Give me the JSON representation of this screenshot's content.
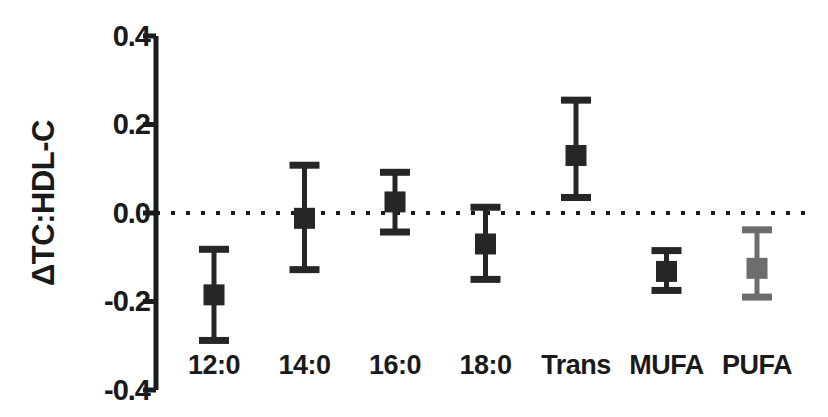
{
  "chart_data": {
    "type": "scatter",
    "title": "",
    "xlabel": "",
    "ylabel": "ΔTC:HDL-C",
    "ylim": [
      -0.4,
      0.4
    ],
    "yticks": [
      0.4,
      0.2,
      0.0,
      -0.2,
      -0.4
    ],
    "ytick_labels": [
      "0.4",
      "0.2",
      "0.0",
      "-0.2",
      "-0.4"
    ],
    "grid": false,
    "legend": "none",
    "zero_reference_line": {
      "value": 0.0,
      "style": "dotted"
    },
    "categories": [
      "12:0",
      "14:0",
      "16:0",
      "18:0",
      "Trans",
      "MUFA",
      "PUFA"
    ],
    "values": [
      -0.185,
      -0.012,
      0.025,
      -0.07,
      0.13,
      -0.132,
      -0.125
    ],
    "error_low": [
      -0.288,
      -0.128,
      -0.043,
      -0.15,
      0.035,
      -0.175,
      -0.19
    ],
    "error_high": [
      -0.082,
      0.108,
      0.092,
      0.013,
      0.255,
      -0.085,
      -0.038
    ],
    "marker_colors": [
      "#262626",
      "#262626",
      "#262626",
      "#262626",
      "#262626",
      "#262626",
      "#6d6d6d"
    ],
    "series": [
      {
        "name": "ΔTC:HDL-C",
        "points": [
          {
            "category": "12:0",
            "value": -0.185,
            "low": -0.288,
            "high": -0.082,
            "color": "#262626"
          },
          {
            "category": "14:0",
            "value": -0.012,
            "low": -0.128,
            "high": 0.108,
            "color": "#262626"
          },
          {
            "category": "16:0",
            "value": 0.025,
            "low": -0.043,
            "high": 0.092,
            "color": "#262626"
          },
          {
            "category": "18:0",
            "value": -0.07,
            "low": -0.15,
            "high": 0.013,
            "color": "#262626"
          },
          {
            "category": "Trans",
            "value": 0.13,
            "low": 0.035,
            "high": 0.255,
            "color": "#262626"
          },
          {
            "category": "MUFA",
            "value": -0.132,
            "low": -0.175,
            "high": -0.085,
            "color": "#262626"
          },
          {
            "category": "PUFA",
            "value": -0.125,
            "low": -0.19,
            "high": -0.038,
            "color": "#6d6d6d"
          }
        ]
      }
    ]
  },
  "axis": {
    "line_color": "#1a1a1a",
    "zero_line_color": "#1a1a1a"
  }
}
